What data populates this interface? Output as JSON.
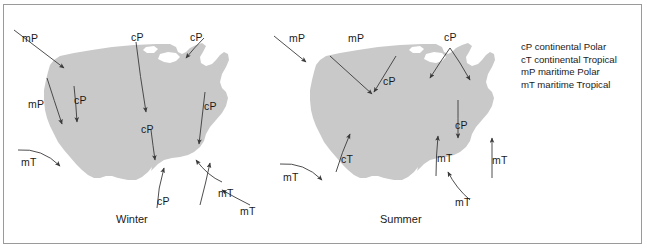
{
  "figure": {
    "background_color": "#ffffff",
    "frame_color": "#9a9a9a",
    "map_fill_color": "#c9c9c9",
    "arrow_color": "#3a3a3a",
    "text_color": "#1a1a1a"
  },
  "legend": {
    "entries": [
      "cP continental Polar",
      "cT continental Tropical",
      "mP maritime Polar",
      "mT maritime Tropical"
    ]
  },
  "maps": [
    {
      "caption": "Winter",
      "labels": [
        {
          "text": "mP",
          "x": 22,
          "y": 33
        },
        {
          "text": "cP",
          "x": 131,
          "y": 32
        },
        {
          "text": "cP",
          "x": 190,
          "y": 32
        },
        {
          "text": "mP",
          "x": 28,
          "y": 99
        },
        {
          "text": "cP",
          "x": 74,
          "y": 95
        },
        {
          "text": "cP",
          "x": 204,
          "y": 101
        },
        {
          "text": "cP",
          "x": 141,
          "y": 124
        },
        {
          "text": "mT",
          "x": 21,
          "y": 157
        },
        {
          "text": "cP",
          "x": 157,
          "y": 196
        },
        {
          "text": "mT",
          "x": 218,
          "y": 188
        },
        {
          "text": "mT",
          "x": 240,
          "y": 206
        }
      ]
    },
    {
      "caption": "Summer",
      "labels": [
        {
          "text": "mP",
          "x": 289,
          "y": 33
        },
        {
          "text": "mP",
          "x": 348,
          "y": 33
        },
        {
          "text": "cP",
          "x": 444,
          "y": 32
        },
        {
          "text": "cP",
          "x": 383,
          "y": 76
        },
        {
          "text": "cP",
          "x": 455,
          "y": 120
        },
        {
          "text": "cT",
          "x": 341,
          "y": 154
        },
        {
          "text": "mT",
          "x": 283,
          "y": 172
        },
        {
          "text": "mT",
          "x": 437,
          "y": 153
        },
        {
          "text": "mT",
          "x": 492,
          "y": 155
        },
        {
          "text": "mT",
          "x": 455,
          "y": 197
        }
      ]
    }
  ],
  "captions": [
    {
      "text": "Winter",
      "x": 116,
      "y": 213
    },
    {
      "text": "Summer",
      "x": 380,
      "y": 213
    }
  ]
}
